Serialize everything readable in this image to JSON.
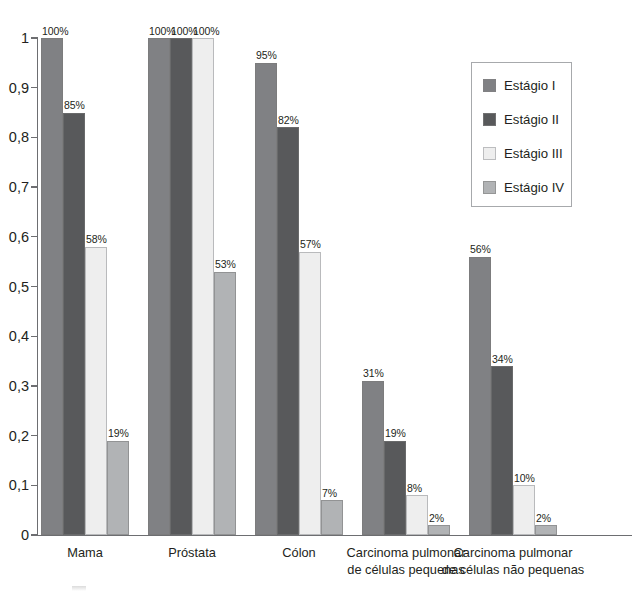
{
  "chart_data": {
    "type": "bar",
    "title": "",
    "subtitle": "",
    "xlabel": "",
    "ylabel": "",
    "ylim": [
      0,
      1
    ],
    "grid": false,
    "legend_position": "right",
    "decimal_separator": ",",
    "categories": [
      "Mama",
      "Próstata",
      "Cólon",
      "Carcinoma pulmonar\nde células pequenas",
      "Carcinoma pulmonar\nde células não pequenas"
    ],
    "y_ticks": [
      {
        "value": 0,
        "label": "0"
      },
      {
        "value": 0.1,
        "label": "0,1"
      },
      {
        "value": 0.2,
        "label": "0,2"
      },
      {
        "value": 0.3,
        "label": "0,3"
      },
      {
        "value": 0.4,
        "label": "0,4"
      },
      {
        "value": 0.5,
        "label": "0,5"
      },
      {
        "value": 0.6,
        "label": "0,6"
      },
      {
        "value": 0.7,
        "label": "0,7"
      },
      {
        "value": 0.8,
        "label": "0,8"
      },
      {
        "value": 0.9,
        "label": "0,9"
      },
      {
        "value": 1,
        "label": "1"
      }
    ],
    "series": [
      {
        "name": "Estágio I",
        "color": "#808184",
        "values": [
          1.0,
          1.0,
          0.95,
          0.31,
          0.56
        ],
        "labels": [
          "100%",
          "100%",
          "95%",
          "31%",
          "56%"
        ]
      },
      {
        "name": "Estágio II",
        "color": "#58595b",
        "values": [
          0.85,
          1.0,
          0.82,
          0.19,
          0.34
        ],
        "labels": [
          "85%",
          "100%",
          "82%",
          "19%",
          "34%"
        ]
      },
      {
        "name": "Estágio III",
        "color": "#eeeeee",
        "values": [
          0.58,
          1.0,
          0.57,
          0.08,
          0.1
        ],
        "labels": [
          "58%",
          "100%",
          "57%",
          "8%",
          "10%"
        ]
      },
      {
        "name": "Estágio IV",
        "color": "#b1b3b5",
        "values": [
          0.19,
          0.53,
          0.07,
          0.02,
          0.02
        ],
        "labels": [
          "19%",
          "53%",
          "7%",
          "2%",
          "2%"
        ]
      }
    ]
  },
  "legend": {
    "entries": [
      {
        "label": "Estágio I"
      },
      {
        "label": "Estágio II"
      },
      {
        "label": "Estágio III"
      },
      {
        "label": "Estágio IV"
      }
    ]
  }
}
